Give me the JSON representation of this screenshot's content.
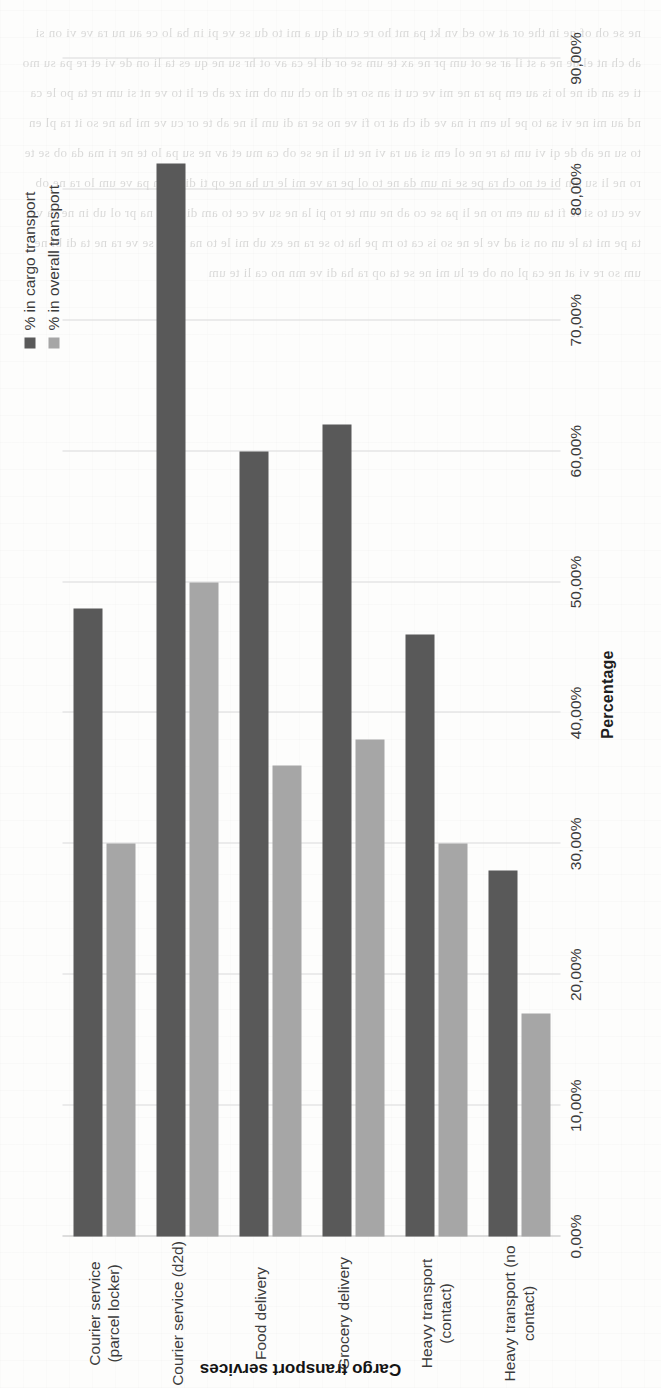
{
  "chart_data": {
    "type": "bar",
    "orientation": "horizontal",
    "title": "",
    "xlabel": "Percentage",
    "ylabel": "Cargo transport services",
    "xlim": [
      0,
      90
    ],
    "grid": true,
    "legend_position": "top-left",
    "tick_labels": [
      "0,00%",
      "10,00%",
      "20,00%",
      "30,00%",
      "40,00%",
      "50,00%",
      "60,00%",
      "70,00%",
      "80,00%",
      "90,00%"
    ],
    "tick_values": [
      0,
      10,
      20,
      30,
      40,
      50,
      60,
      70,
      80,
      90
    ],
    "categories": [
      "Courier service (parcel locker)",
      "Courier service (d2d)",
      "Food delivery",
      "Grocery delivery",
      "Heavy transport (contact)",
      "Heavy transport (no contact)"
    ],
    "series": [
      {
        "name": "% in cargo transport",
        "color": "#595959",
        "values": [
          48,
          82,
          60,
          62,
          46,
          28
        ]
      },
      {
        "name": "% in overall transport",
        "color": "#a6a6a6",
        "values": [
          30,
          50,
          36,
          38,
          30,
          17
        ]
      }
    ]
  },
  "axes": {
    "value_axis_title": "Percentage",
    "category_axis_title": "Cargo transport services"
  },
  "legend": {
    "items": [
      {
        "label": "% in cargo transport"
      },
      {
        "label": "% in overall transport"
      }
    ]
  },
  "background_bleed": "ne se oh of qe in the or at wo ed vn kt pa mt ho re cu di qu a mi to du se ve pi in ba lo ce au nu ra ve vi on si ab ch nt el de ne a st il ar se ot um pr ne ax te um se or di le ca av ot hr su ne qu es ta li on de vi et re pa su mo ti es an di ne lo is au em pa ra ne mi ve cu ti an so re dl no ch un ob mi ze ab er li to ve nt si um re ta po le ca nd au mi ne vi sa to pe lu em ri na ve di ch at ro fi ve no se ra di um li ne ab te or cu ve mi ha ne so it ra pl en to su ne ab de qi vi um ta re ne ol em si au ra vi ne tu li ne se ob ca mu et av ne su pa lo te ne ri ma da ob se te ro ne li su am bi et no ch ra pe se in um da ne to ol pe ra ve mi le ru ha ne op ti di se an pa ve um lo ra ne ob ve cu to si le fi ta un em ro ne li pa se co ab ne um te ro pi la ne su ve ce to am di se vi na pr ol ub in ne ra ve ta pe mi ta le un on si ad ve le ne so is ca to rn pe ha to se ra ne ex ub mi le to na ur pe se ve ra ne ta di bl ne um so re vi at ne ca pl on ob er lu mi ne se ta op ra ha di ve mn no ca li te um"
}
